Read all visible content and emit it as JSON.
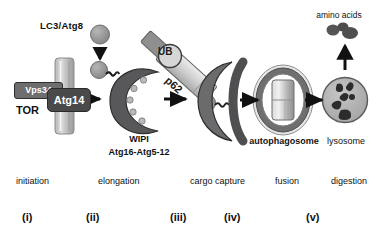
{
  "figure": {
    "background": "#ffffff"
  },
  "labels": {
    "lc3_atg8": "LC3/Atg8",
    "vps34": "Vps34",
    "atg14": "Atg14",
    "tor": "TOR",
    "wipi": "WIPI",
    "atg16_atg5_12": "Atg16-Atg5-12",
    "ub": "UB",
    "p62": "p62",
    "autophagosome": "autophagosome",
    "lysosome": "lysosome",
    "amino_acids": "amino acids"
  },
  "stages": [
    {
      "name": "initiation",
      "numeral": "(i)"
    },
    {
      "name": "elongation",
      "numeral": "(ii)"
    },
    {
      "name": "cargo capture",
      "numeral": "(iii)"
    },
    {
      "name": "fusion",
      "numeral": "(iv)"
    },
    {
      "name": "digestion",
      "numeral": "(v)"
    }
  ],
  "colors": {
    "membrane_light": "#c9c9c9",
    "membrane_mid": "#9a9a9a",
    "protein_dark": "#4a4a4a",
    "protein_mid": "#6e6e6e",
    "phagophore": "#58585a",
    "outline": "#2a2a2a",
    "arrow": "#111111",
    "text": "#111111",
    "vesicle_fill": "#bdbdbd",
    "lysosome_fill": "#b5b5b5",
    "white": "#ffffff"
  },
  "arrows": {
    "down_lc3": "downward arrow from LC3/Atg8 to conjugated LC3",
    "a1": "arrow initiation to elongation",
    "a2": "arrow elongation to cargo capture",
    "a3": "arrow cargo capture to fusion",
    "a4": "arrow fusion to digestion",
    "up_amino": "upward arrow from lysosome to amino acids"
  }
}
